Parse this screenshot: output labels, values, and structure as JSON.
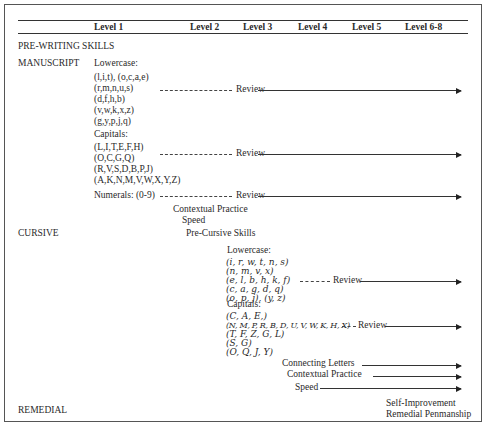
{
  "header": {
    "levels": [
      "Level 1",
      "Level 2",
      "Level 3",
      "Level 4",
      "Level 5",
      "Level 6-8"
    ]
  },
  "sections": {
    "prewriting": "PRE-WRITING SKILLS",
    "manuscript": "MANUSCRIPT",
    "cursive": "CURSIVE",
    "remedial": "REMEDIAL"
  },
  "manuscript": {
    "lowercase_label": "Lowercase:",
    "lowercase_groups": [
      "(l,i,t), (o,c,a,e)",
      "(r,m,n,u,s)",
      "(d,f,h,b)",
      "(v,w,k,x,z)",
      "(g,y,p,j,q)"
    ],
    "capitals_label": "Capitals:",
    "capital_groups": [
      "(L,I,T,E,F,H)",
      "(O,C,G,Q)",
      "(R,V,S,D,B,P,J)",
      "(A,K,N,M,V,W,X,Y,Z)"
    ],
    "numerals": "Numerals:  (0-9)",
    "review": "Review",
    "contextual_practice": "Contextual Practice",
    "speed": "Speed"
  },
  "cursive": {
    "pre_cursive": "Pre-Cursive Skills",
    "lowercase_label": "Lowercase:",
    "lowercase_groups": [
      "(i, r, w, t, n, s)",
      "(n, m, v, x)",
      "(e, l, b, h, k, f)",
      "(c, a, g, d, q)",
      "(o, p, j), (y, z)"
    ],
    "capitals_label": "Capitals:",
    "capital_groups": [
      "(C, A, E,)",
      "(N, M, P, R, B, D, U, V, W, K, H, X)",
      "(T, F, Z, G, L)",
      "(S, G)",
      "(O, Q, J, Y)"
    ],
    "review": "Review",
    "connecting_letters": "Connecting Letters",
    "contextual_practice": "Contextual Practice",
    "speed": "Speed"
  },
  "remedial": {
    "self_improvement": "Self-Improvement",
    "remedial_penmanship": "Remedial Penmanship"
  }
}
